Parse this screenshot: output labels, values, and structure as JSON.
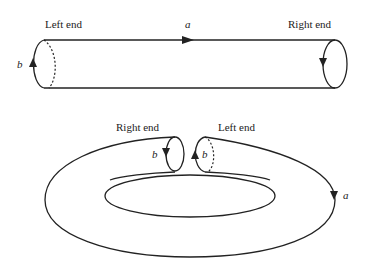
{
  "cylinder": {
    "left_label": "Left end",
    "right_label": "Right end",
    "edge_a": "a",
    "edge_b": "b"
  },
  "torus": {
    "right_label": "Right end",
    "left_label": "Left end",
    "edge_a": "a",
    "edge_b_right": "b",
    "edge_b_left": "b"
  }
}
